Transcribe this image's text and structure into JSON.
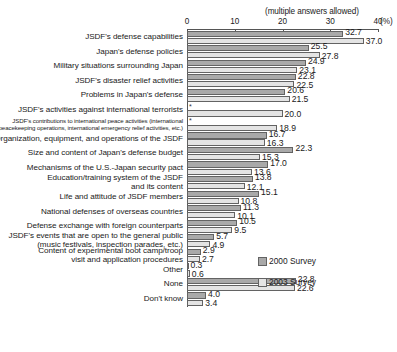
{
  "chart_data": {
    "type": "bar",
    "orientation": "horizontal",
    "title": "",
    "note": "(multiple answers allowed)",
    "xlabel": "(%)",
    "ylabel": "",
    "xlim": [
      0,
      40
    ],
    "xticks": [
      0,
      10,
      20,
      30,
      40
    ],
    "xtick_labels": [
      "0",
      "10",
      "20",
      "30",
      "40"
    ],
    "grid": false,
    "legend_position": "right-middle",
    "missing_marker": "*",
    "series": [
      {
        "name": "2000 Survey",
        "color": "#a9a9a9",
        "values": [
          32.7,
          25.5,
          24.9,
          22.8,
          20.6,
          null,
          null,
          16.7,
          22.3,
          17.0,
          13.8,
          15.1,
          11.3,
          10.5,
          5.7,
          2.9,
          0.3,
          22.8,
          4.0
        ]
      },
      {
        "name": "2003 Survey",
        "color": "#e4e4e4",
        "values": [
          37.0,
          27.8,
          23.1,
          22.5,
          21.5,
          20.0,
          18.9,
          16.3,
          15.3,
          13.6,
          12.1,
          10.8,
          10.1,
          9.5,
          4.9,
          2.7,
          0.6,
          22.6,
          3.4
        ]
      }
    ],
    "categories": [
      "JSDF's defense capabilities",
      "Japan's defense policies",
      "Military situations surrounding Japan",
      "JSDF's disaster relief activities",
      "Problems in Japan's defense",
      "JSDF's activities against international terrorists",
      "JSDF's contributions to international peace activities (international peacekeeping operations, international emergency relief activities, etc.)",
      "Organization, equipment, and operations of the JSDF",
      "Size and content of Japan's defense budget",
      "Mechanisms of the U.S.-Japan security pact",
      "Education/training system of the JSDF and its content",
      "Life and attitude of JSDF members",
      "National defenses of overseas countries",
      "Defense exchange with foreign counterparts",
      "JSDF's events that are open to the general public (music festivals, inspection parades, etc.)",
      "Content of experimental boot camp/troop visit and application procedures",
      "Other",
      "None",
      "Don't know"
    ],
    "category_lines": [
      [
        "JSDF's defense capabilities"
      ],
      [
        "Japan's defense policies"
      ],
      [
        "Military situations surrounding Japan"
      ],
      [
        "JSDF's disaster relief activities"
      ],
      [
        "Problems in Japan's defense"
      ],
      [
        "JSDF's activities against international terrorists"
      ],
      [
        "JSDF's contributions to international peace activities (international",
        "peacekeeping operations, international emergency relief activities, etc.)"
      ],
      [
        "Organization, equipment, and operations of the JSDF"
      ],
      [
        "Size and content of Japan's defense budget"
      ],
      [
        "Mechanisms of the U.S.-Japan security pact"
      ],
      [
        "Education/training system of the JSDF",
        "and its content"
      ],
      [
        "Life and attitude of JSDF members"
      ],
      [
        "National defenses of overseas countries"
      ],
      [
        "Defense exchange with foreign counterparts"
      ],
      [
        "JSDF's events that are open to the general public",
        "(music festivals, inspection parades, etc.)"
      ],
      [
        "Content of experimental boot camp/troop",
        "visit and application procedures"
      ],
      [
        "Other"
      ],
      [
        "None"
      ],
      [
        "Don't know"
      ]
    ]
  },
  "labels": {
    "note": "(multiple answers allowed)",
    "unit": "(%)",
    "tick_0": "0",
    "tick_10": "10",
    "tick_20": "20",
    "tick_30": "30",
    "tick_40": "40",
    "legend_2000": "2000 Survey",
    "legend_2003": "2003 Survey"
  }
}
